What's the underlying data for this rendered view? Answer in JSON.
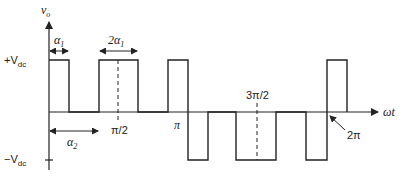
{
  "diagram": {
    "type": "waveform",
    "y_axis_label": "v",
    "y_axis_label_sub": "o",
    "x_axis_label": "ωt",
    "levels": {
      "positive": "+V",
      "positive_sub": "dc",
      "negative": "−V",
      "negative_sub": "dc"
    },
    "annotations": {
      "alpha1": "α",
      "alpha1_sub": "1",
      "two_alpha1": "2α",
      "two_alpha1_sub": "1",
      "alpha2": "α",
      "alpha2_sub": "2",
      "pi_over_2": "π/2",
      "pi": "π",
      "three_pi_over_2": "3π/2",
      "two_pi": "2π"
    },
    "pulses_positive": [
      {
        "start": 0,
        "end": "α1"
      },
      {
        "start": "α2",
        "end": "π−α2"
      },
      {
        "start": "π−α1",
        "end": "π"
      },
      {
        "start": "2π",
        "end": "2π+α1"
      }
    ],
    "pulses_negative": [
      {
        "start": "π",
        "end": "π+α1"
      },
      {
        "start": "π+α2",
        "end": "2π−α2"
      },
      {
        "start": "2π−α1",
        "end": "2π"
      }
    ]
  }
}
